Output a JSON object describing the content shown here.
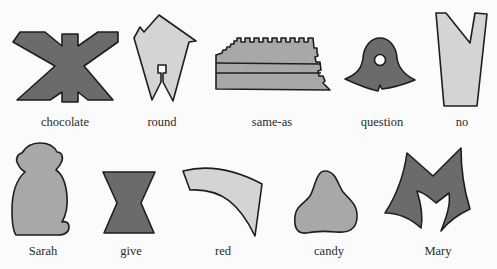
{
  "diagram": {
    "colors": {
      "dark": "#6b6b6b",
      "medium": "#a8a8a8",
      "light": "#d4d4d4",
      "stroke": "#1e1e1e",
      "background": "#fbfbfb",
      "text": "#2a2a2a"
    },
    "symbols": [
      {
        "id": "chocolate",
        "label": "chocolate",
        "shape": "x-cross",
        "fill": "dark"
      },
      {
        "id": "round",
        "label": "round",
        "shape": "notched-pentagon",
        "fill": "light"
      },
      {
        "id": "same-as",
        "label": "same-as",
        "shape": "serrated-tablet",
        "fill": "medium"
      },
      {
        "id": "question",
        "label": "question",
        "shape": "bell-with-hole",
        "fill": "dark"
      },
      {
        "id": "no",
        "label": "no",
        "shape": "v-notch-trapezoid",
        "fill": "light"
      },
      {
        "id": "sarah",
        "label": "Sarah",
        "shape": "monkey-silhouette",
        "fill": "medium"
      },
      {
        "id": "give",
        "label": "give",
        "shape": "hourglass",
        "fill": "dark"
      },
      {
        "id": "red",
        "label": "red",
        "shape": "curved-band",
        "fill": "light"
      },
      {
        "id": "candy",
        "label": "candy",
        "shape": "rounded-triangle",
        "fill": "medium"
      },
      {
        "id": "mary",
        "label": "Mary",
        "shape": "m-shape",
        "fill": "dark"
      }
    ]
  }
}
